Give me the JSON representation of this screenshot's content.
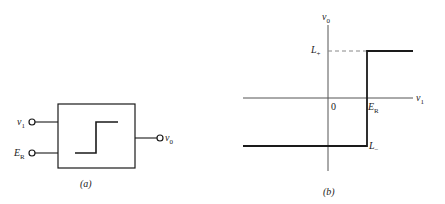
{
  "figure_a": {
    "caption": "(a)",
    "inputs": [
      {
        "name": "v",
        "sub": "1"
      },
      {
        "name": "E",
        "sub": "R"
      }
    ],
    "output": {
      "name": "v",
      "sub": "0"
    },
    "block_symbol": "step"
  },
  "figure_b": {
    "caption": "(b)",
    "y_axis": {
      "name": "v",
      "sub": "0"
    },
    "x_axis": {
      "name": "v",
      "sub": "1"
    },
    "origin": "0",
    "threshold": {
      "name": "E",
      "sub": "R"
    },
    "high_level": {
      "name": "L",
      "sub": "+"
    },
    "low_level": {
      "name": "L",
      "sub": "−"
    }
  },
  "colors": {
    "line": "#1a1a1a",
    "axis": "#555555",
    "dashed": "#888888"
  }
}
